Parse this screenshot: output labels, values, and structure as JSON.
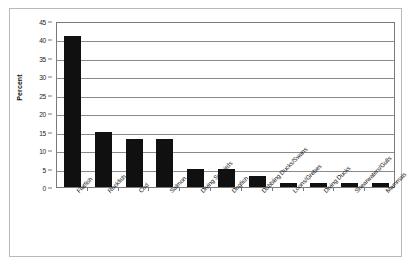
{
  "chart_data": {
    "type": "bar",
    "title": "",
    "xlabel": "",
    "ylabel": "Percent",
    "ylim": [
      0,
      45
    ],
    "ytick_values": [
      0,
      5,
      10,
      15,
      20,
      25,
      30,
      35,
      40,
      45
    ],
    "ytick_labels": [
      "0",
      "5",
      "10",
      "15",
      "20",
      "25",
      "30",
      "35",
      "40",
      "45"
    ],
    "grid": true,
    "legend": "none",
    "bar_color": "#101010",
    "categories": [
      "Flatfish",
      "Rockfish",
      "Cod",
      "Salmon",
      "Diving Seabirds",
      "Dogfish",
      "Dabbling Ducks/Swans",
      "Loons/Grebes",
      "Diving Ducks",
      "Shearwaters/Gulls",
      "Mammals"
    ],
    "values": [
      41,
      15,
      13,
      13,
      5,
      5,
      3,
      1,
      1,
      1,
      1
    ]
  }
}
